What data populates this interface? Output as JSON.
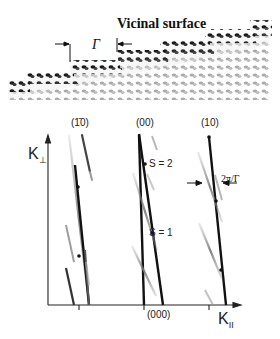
{
  "title": "Vicinal surface",
  "terrace_width_symbol": "Γ",
  "reciprocal_space": {
    "axis_vertical_label": "K",
    "axis_vertical_sub": "⊥",
    "axis_horizontal_label": "K",
    "axis_horizontal_sub": "II",
    "rod_labels": [
      "(1̄0)",
      "(00)",
      "(10)"
    ],
    "origin_label": "(000)",
    "order_labels": [
      "S = 2",
      "S = 1"
    ],
    "splitting_label": "2π/Γ"
  },
  "colors": {
    "dark_atom": "#1a1a1a",
    "light_atom": "#a8a8a8",
    "rod_dark": "#111111",
    "rod_light": "#9a9a9a",
    "axis": "#222222"
  }
}
